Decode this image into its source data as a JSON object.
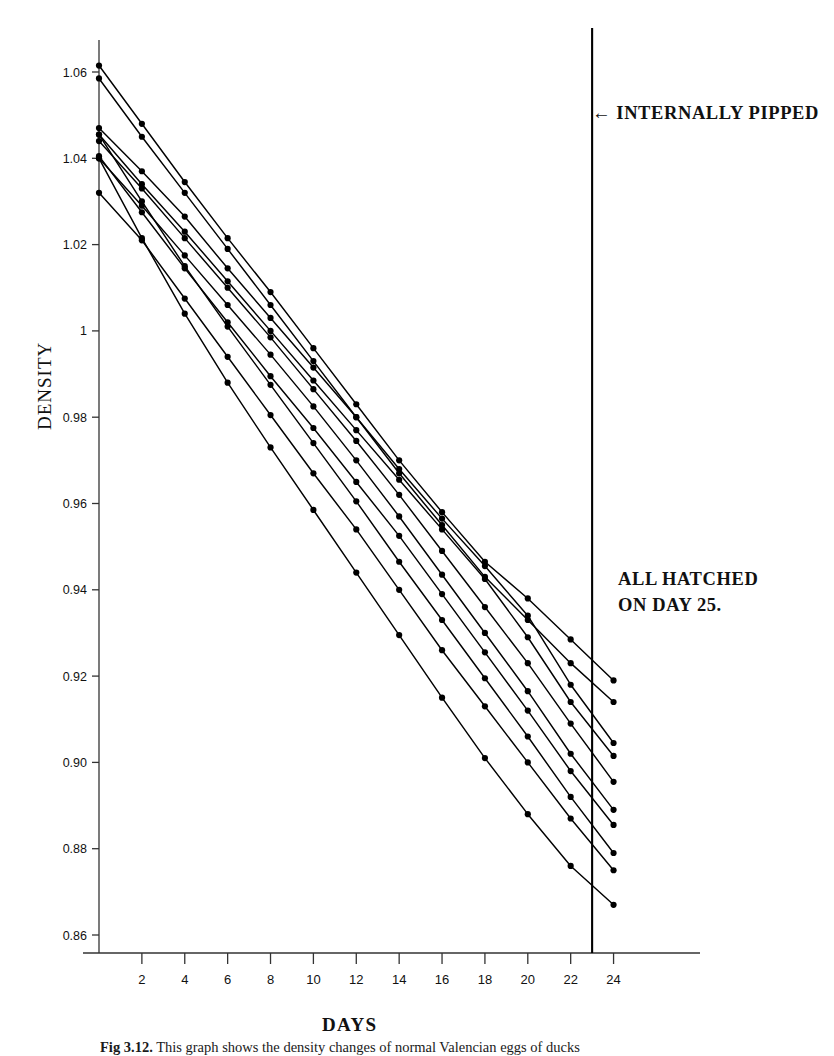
{
  "figure": {
    "caption_label": "Fig 3.12.",
    "caption_text": " This graph shows the density changes of normal Valencian eggs of ducks"
  },
  "axes": {
    "ylabel": "DENSITY",
    "xlabel": "DAYS",
    "yticks": [
      "1.06",
      "1.04",
      "1.02",
      "1",
      "0.98",
      "0.96",
      "0.94",
      "0.92",
      "0.90",
      "0.88",
      "0.86"
    ],
    "xticks": [
      "2",
      "4",
      "6",
      "8",
      "10",
      "12",
      "14",
      "16",
      "18",
      "20",
      "22",
      "24"
    ]
  },
  "annotations": {
    "pipped": "INTERNALLY PIPPED",
    "hatched_line1": "ALL HATCHED",
    "hatched_line2": "ON DAY 25.",
    "arrow_glyph": "←"
  },
  "colors": {
    "ink": "#111111",
    "line": "#000000",
    "axis": "#333333",
    "background": "#ffffff"
  },
  "chart_data": {
    "type": "line",
    "title": "",
    "xlabel": "DAYS",
    "ylabel": "DENSITY",
    "xlim": [
      0,
      25
    ],
    "ylim": [
      0.85,
      1.07
    ],
    "grid": false,
    "legend": false,
    "marker": "filled-circle",
    "marker_interval_days": 2,
    "x": [
      0,
      2,
      4,
      6,
      8,
      10,
      12,
      14,
      16,
      18,
      20,
      22,
      24
    ],
    "vertical_marker": {
      "x": 23,
      "label": "INTERNALLY PIPPED"
    },
    "note": "ALL HATCHED ON DAY 25.",
    "series": [
      {
        "name": "egg-1",
        "values": [
          1.0615,
          1.048,
          1.0345,
          1.0215,
          1.009,
          0.996,
          0.983,
          0.97,
          0.958,
          0.9465,
          0.938,
          0.9285,
          0.919
        ]
      },
      {
        "name": "egg-2",
        "values": [
          1.0585,
          1.045,
          1.032,
          1.019,
          1.006,
          0.993,
          0.98,
          0.967,
          0.955,
          0.943,
          0.933,
          0.923,
          0.914
        ]
      },
      {
        "name": "egg-3",
        "values": [
          1.047,
          1.037,
          1.0265,
          1.0145,
          1.003,
          0.9915,
          0.98,
          0.968,
          0.9565,
          0.9455,
          0.934,
          0.918,
          0.9045
        ]
      },
      {
        "name": "egg-4",
        "values": [
          1.0455,
          1.034,
          1.023,
          1.0115,
          1.0,
          0.9885,
          0.977,
          0.9655,
          0.954,
          0.9425,
          0.929,
          0.914,
          0.9015
        ]
      },
      {
        "name": "egg-5",
        "values": [
          1.044,
          1.033,
          1.0215,
          1.01,
          0.9985,
          0.9865,
          0.9745,
          0.962,
          0.949,
          0.936,
          0.923,
          0.909,
          0.8955
        ]
      },
      {
        "name": "egg-6",
        "values": [
          1.04,
          1.029,
          1.0175,
          1.006,
          0.9945,
          0.9825,
          0.97,
          0.957,
          0.9435,
          0.93,
          0.9165,
          0.902,
          0.889
        ]
      },
      {
        "name": "egg-7",
        "values": [
          1.0405,
          1.0275,
          1.0145,
          1.002,
          0.9895,
          0.9775,
          0.965,
          0.9525,
          0.939,
          0.9255,
          0.912,
          0.898,
          0.8855
        ]
      },
      {
        "name": "egg-8",
        "values": [
          1.0455,
          1.03,
          1.015,
          1.001,
          0.9875,
          0.974,
          0.9605,
          0.9465,
          0.933,
          0.9195,
          0.906,
          0.892,
          0.879
        ]
      },
      {
        "name": "egg-9",
        "values": [
          1.032,
          1.021,
          1.0075,
          0.994,
          0.9805,
          0.967,
          0.954,
          0.94,
          0.926,
          0.913,
          0.9,
          0.887,
          0.875
        ]
      },
      {
        "name": "egg-10",
        "values": [
          1.04,
          1.0215,
          1.004,
          0.988,
          0.973,
          0.9585,
          0.944,
          0.9295,
          0.915,
          0.901,
          0.888,
          0.876,
          0.867
        ]
      }
    ]
  }
}
